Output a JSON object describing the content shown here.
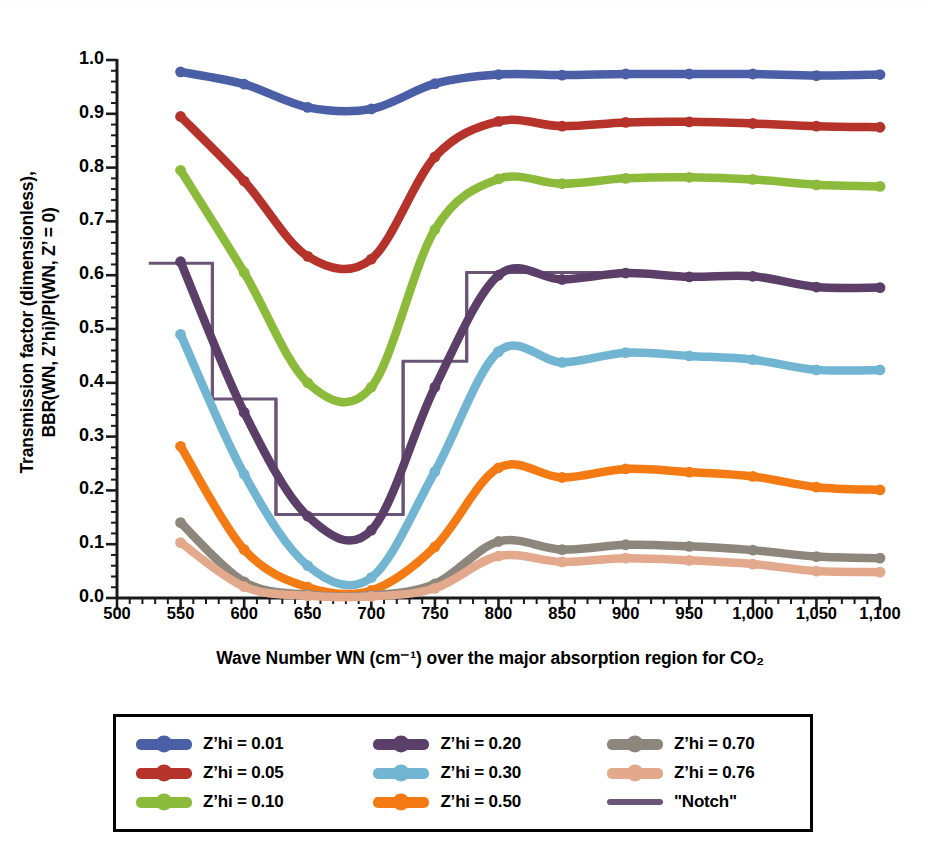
{
  "axes": {
    "ylabel_line1": "Transmission factor (dimensionless),",
    "ylabel_line2": "BBR(WN, Z’hi)/PI(WN, Z’ = 0)",
    "xlabel": "Wave Number WN (cm⁻¹) over the major absorption region for CO₂",
    "yticks": [
      "0.0",
      "0.1",
      "0.2",
      "0.3",
      "0.4",
      "0.5",
      "0.6",
      "0.7",
      "0.8",
      "0.9",
      "1.0"
    ],
    "xticks": [
      "500",
      "550",
      "600",
      "650",
      "700",
      "750",
      "800",
      "850",
      "900",
      "950",
      "1,000",
      "1,050",
      "1,100"
    ]
  },
  "legend": {
    "columns": [
      [
        {
          "label": "Z’hi = 0.01",
          "color": "#4a5fa5",
          "style": "marker"
        },
        {
          "label": "Z’hi = 0.05",
          "color": "#b5332a",
          "style": "marker"
        },
        {
          "label": "Z’hi = 0.10",
          "color": "#8cbb3b",
          "style": "marker"
        }
      ],
      [
        {
          "label": "Z’hi = 0.20",
          "color": "#5c3f69",
          "style": "marker"
        },
        {
          "label": "Z’hi = 0.30",
          "color": "#71b5d2",
          "style": "marker"
        },
        {
          "label": "Z’hi = 0.50",
          "color": "#f47b14",
          "style": "marker"
        }
      ],
      [
        {
          "label": "Z’hi = 0.70",
          "color": "#8d867d",
          "style": "marker"
        },
        {
          "label": "Z’hi = 0.76",
          "color": "#e3a98c",
          "style": "marker"
        },
        {
          "label": "\"Notch\"",
          "color": "#6b5577",
          "style": "line"
        }
      ]
    ]
  },
  "chart_data": {
    "type": "line",
    "title": "",
    "xlabel": "Wave Number WN (cm⁻¹) over the major absorption region for CO₂",
    "ylabel": "Transmission factor (dimensionless), BBR(WN, Z’hi)/PI(WN, Z’ = 0)",
    "xlim": [
      500,
      1100
    ],
    "ylim": [
      0.0,
      1.0
    ],
    "grid": false,
    "legend_position": "below",
    "x": [
      550,
      600,
      650,
      700,
      750,
      800,
      850,
      900,
      950,
      1000,
      1050,
      1100
    ],
    "series": [
      {
        "name": "Z’hi = 0.01",
        "color": "#4a5fa5",
        "values": [
          0.978,
          0.955,
          0.912,
          0.909,
          0.956,
          0.973,
          0.972,
          0.974,
          0.974,
          0.974,
          0.971,
          0.973
        ]
      },
      {
        "name": "Z’hi = 0.05",
        "color": "#b5332a",
        "values": [
          0.895,
          0.775,
          0.635,
          0.63,
          0.82,
          0.886,
          0.877,
          0.884,
          0.885,
          0.882,
          0.877,
          0.875
        ]
      },
      {
        "name": "Z’hi = 0.10",
        "color": "#8cbb3b",
        "values": [
          0.795,
          0.605,
          0.4,
          0.392,
          0.685,
          0.779,
          0.77,
          0.78,
          0.782,
          0.778,
          0.768,
          0.765
        ]
      },
      {
        "name": "Z’hi = 0.20",
        "color": "#5c3f69",
        "values": [
          0.625,
          0.345,
          0.152,
          0.126,
          0.392,
          0.6,
          0.592,
          0.604,
          0.597,
          0.598,
          0.578,
          0.577
        ]
      },
      {
        "name": "Z’hi = 0.30",
        "color": "#71b5d2",
        "values": [
          0.49,
          0.23,
          0.06,
          0.038,
          0.235,
          0.458,
          0.438,
          0.456,
          0.45,
          0.443,
          0.424,
          0.424
        ]
      },
      {
        "name": "Z’hi = 0.50",
        "color": "#f47b14",
        "values": [
          0.282,
          0.09,
          0.02,
          0.014,
          0.095,
          0.242,
          0.224,
          0.24,
          0.234,
          0.226,
          0.206,
          0.201
        ]
      },
      {
        "name": "Z’hi = 0.70",
        "color": "#8d867d",
        "values": [
          0.14,
          0.03,
          0.006,
          0.005,
          0.026,
          0.105,
          0.09,
          0.099,
          0.096,
          0.089,
          0.077,
          0.074
        ]
      },
      {
        "name": "Z’hi = 0.76",
        "color": "#e3a98c",
        "values": [
          0.103,
          0.021,
          0.004,
          0.003,
          0.018,
          0.078,
          0.067,
          0.074,
          0.07,
          0.063,
          0.05,
          0.048
        ]
      }
    ],
    "notch": {
      "name": "\"Notch\"",
      "color": "#6b5577",
      "type": "step",
      "edges": [
        525,
        575,
        625,
        725,
        775,
        880
      ],
      "levels": [
        0.622,
        0.37,
        0.155,
        0.44,
        0.605
      ]
    }
  }
}
